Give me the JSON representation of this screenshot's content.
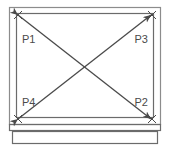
{
  "diagram": {
    "background_color": "#ffffff",
    "line_color": "#4a4a4a",
    "label_color": "#4a4a4a",
    "outer_border_color": "#8c8c8c",
    "canvas": {
      "width": 173,
      "height": 147
    },
    "outer_frame": {
      "x": 9,
      "y": 7,
      "width": 152,
      "height": 118
    },
    "inner_frame": {
      "x": 16,
      "y": 13,
      "width": 138,
      "height": 105
    },
    "sill_upper_band": {
      "x": 9,
      "y": 125,
      "width": 152,
      "height": 6
    },
    "sill_lower_band": {
      "x": 12,
      "y": 131,
      "width": 146,
      "height": 13
    },
    "diagonals": [
      {
        "name": "diagonal-p1-p2",
        "from": "P1",
        "to": "P2",
        "x1": 18,
        "y1": 15,
        "x2": 152,
        "y2": 120
      },
      {
        "name": "diagonal-p4-p3",
        "from": "P4",
        "to": "P3",
        "x1": 18,
        "y1": 120,
        "x2": 152,
        "y2": 15
      }
    ],
    "intersection": {
      "x": 85,
      "y": 67
    },
    "corner_markers": [
      {
        "name": "corner-marker-p1",
        "x": 18,
        "y": 15
      },
      {
        "name": "corner-marker-p3",
        "x": 152,
        "y": 15
      },
      {
        "name": "corner-marker-p4",
        "x": 18,
        "y": 120
      },
      {
        "name": "corner-marker-p2",
        "x": 152,
        "y": 120
      }
    ],
    "labels": [
      {
        "id": "p1",
        "text": "P1",
        "x": 22,
        "y": 42,
        "anchor": "start",
        "corner": "top-left"
      },
      {
        "id": "p3",
        "text": "P3",
        "x": 148,
        "y": 42,
        "anchor": "end",
        "corner": "top-right"
      },
      {
        "id": "p4",
        "text": "P4",
        "x": 22,
        "y": 105,
        "anchor": "start",
        "corner": "bottom-left"
      },
      {
        "id": "p2",
        "text": "P2",
        "x": 148,
        "y": 105,
        "anchor": "end",
        "corner": "bottom-right"
      }
    ]
  }
}
